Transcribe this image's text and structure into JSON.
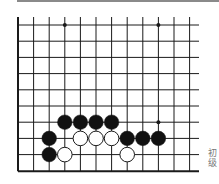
{
  "diagram": {
    "type": "go-board-fragment",
    "colors": {
      "line": "#1a1a1a",
      "black_stone": "#111111",
      "white_stone": "#ffffff",
      "topbar": "#8a8a8a",
      "caption": "#777777"
    },
    "grid": {
      "x0": 18,
      "dx": 15.6,
      "cols": 12,
      "y0": 25,
      "dy": 16.2,
      "rows": 10,
      "top_extent": 17,
      "right_extent": 199
    },
    "star_points": [
      {
        "c": 3,
        "r": 0
      },
      {
        "c": 9,
        "r": 0
      },
      {
        "c": 9,
        "r": 6
      }
    ],
    "stones": [
      {
        "color": "black",
        "c": 3,
        "r": 6
      },
      {
        "color": "black",
        "c": 4,
        "r": 6
      },
      {
        "color": "black",
        "c": 5,
        "r": 6
      },
      {
        "color": "black",
        "c": 6,
        "r": 6
      },
      {
        "color": "black",
        "c": 2,
        "r": 7
      },
      {
        "color": "white",
        "c": 4,
        "r": 7
      },
      {
        "color": "white",
        "c": 5,
        "r": 7
      },
      {
        "color": "white",
        "c": 6,
        "r": 7
      },
      {
        "color": "black",
        "c": 7,
        "r": 7
      },
      {
        "color": "black",
        "c": 8,
        "r": 7
      },
      {
        "color": "black",
        "c": 9,
        "r": 7
      },
      {
        "color": "black",
        "c": 2,
        "r": 8
      },
      {
        "color": "white",
        "c": 3,
        "r": 8
      },
      {
        "color": "white",
        "c": 7,
        "r": 8
      }
    ]
  },
  "caption": {
    "line1": "初",
    "line2": "级"
  }
}
